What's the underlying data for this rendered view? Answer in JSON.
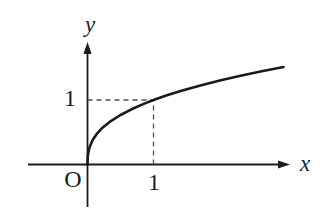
{
  "figure": {
    "background": "#ffffff",
    "axis_color": "#1c1c1c",
    "curve_color": "#1a1a1a",
    "dash_color": "#4f4f4f",
    "labels": {
      "x_axis": "x",
      "y_axis": "y",
      "origin": "O",
      "x_tick_1": "1",
      "y_tick_1": "1"
    }
  },
  "chart_data": {
    "type": "line",
    "title": "",
    "xlabel": "x",
    "ylabel": "y",
    "xlim": [
      -0.9,
      3.3
    ],
    "ylim": [
      -0.8,
      1.9
    ],
    "grid": false,
    "legend": "none",
    "guides": [
      {
        "style": "dashed",
        "from": [
          0,
          1
        ],
        "to": [
          1,
          1
        ]
      },
      {
        "style": "dashed",
        "from": [
          1,
          0
        ],
        "to": [
          1,
          1
        ]
      }
    ],
    "tick_annotations": [
      {
        "axis": "x",
        "value": 1,
        "text": "1"
      },
      {
        "axis": "y",
        "value": 1,
        "text": "1"
      },
      {
        "axis": "origin",
        "value": 0,
        "text": "O"
      }
    ],
    "series": [
      {
        "name": "curve",
        "points": [
          [
            0,
            0
          ],
          [
            0.005,
            0.134
          ],
          [
            0.01,
            0.174
          ],
          [
            0.03,
            0.265
          ],
          [
            0.076,
            0.375
          ],
          [
            0.136,
            0.469
          ],
          [
            0.227,
            0.57
          ],
          [
            0.348,
            0.67
          ],
          [
            0.5,
            0.768
          ],
          [
            0.682,
            0.864
          ],
          [
            0.879,
            0.952
          ],
          [
            1,
            1
          ],
          [
            1.18,
            1.066
          ],
          [
            1.41,
            1.139
          ],
          [
            1.71,
            1.227
          ],
          [
            2.02,
            1.305
          ],
          [
            2.32,
            1.376
          ],
          [
            2.62,
            1.442
          ],
          [
            2.97,
            1.512
          ]
        ]
      }
    ]
  }
}
